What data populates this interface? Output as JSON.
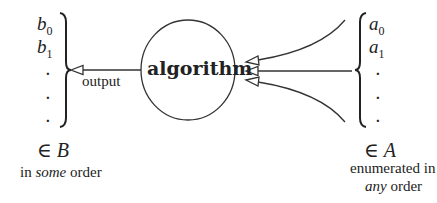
{
  "diagram": {
    "center_node": {
      "label": "algorithm",
      "shape": "ellipse"
    },
    "left_set": {
      "elements": [
        "b",
        "b",
        ".",
        ".",
        "."
      ],
      "subscripts": [
        "0",
        "1",
        "",
        "",
        ""
      ],
      "membership_symbol": "∈",
      "set_name": "B",
      "caption_prefix": "in ",
      "caption_emph": "some",
      "caption_suffix": " order"
    },
    "right_set": {
      "elements": [
        "a",
        "a",
        ".",
        ".",
        "."
      ],
      "subscripts": [
        "0",
        "1",
        "",
        "",
        ""
      ],
      "membership_symbol": "∈",
      "set_name": "A",
      "caption_line1": "enumerated in",
      "caption_emph": "any",
      "caption_suffix": " order"
    },
    "edges": [
      {
        "from": "algorithm",
        "to": "left_set",
        "label": "output"
      },
      {
        "from": "right_set",
        "to": "algorithm",
        "label": ""
      },
      {
        "from": "right_set",
        "to": "algorithm",
        "label": ""
      },
      {
        "from": "right_set",
        "to": "algorithm",
        "label": ""
      }
    ]
  }
}
